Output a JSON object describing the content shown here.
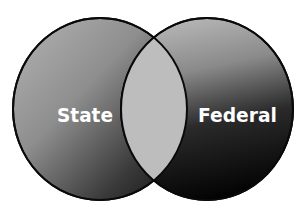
{
  "diagram": {
    "type": "venn",
    "sets": [
      {
        "id": "state",
        "label": "State"
      },
      {
        "id": "federal",
        "label": "Federal"
      }
    ],
    "intersection": {
      "label": ""
    },
    "colors": {
      "outline": "#0a0a0a",
      "intersection_fill": "#bdbdbd",
      "left_gradient_light": "#a6a6a6",
      "left_gradient_dark": "#1a1a1a",
      "right_gradient_light": "#b0b0b0",
      "right_gradient_dark": "#050505",
      "label_text": "#ffffff"
    }
  }
}
